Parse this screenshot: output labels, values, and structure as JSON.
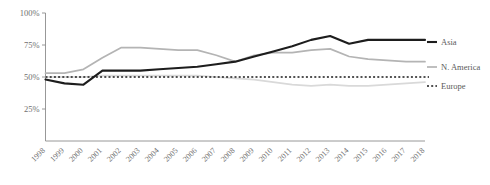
{
  "chart_data": {
    "type": "line",
    "title": "",
    "subtitle": "",
    "xlabel": "",
    "ylabel": "",
    "grid": false,
    "legend_position": "right",
    "xlim": [
      1998,
      2018
    ],
    "ylim": [
      0,
      100
    ],
    "y_tick_labels": [
      "100%",
      "75%",
      "50%",
      "25%"
    ],
    "y_tick_values": [
      100,
      75,
      50,
      25
    ],
    "x": [
      1998,
      1999,
      2000,
      2001,
      2002,
      2003,
      2004,
      2005,
      2006,
      2007,
      2008,
      2009,
      2010,
      2011,
      2012,
      2013,
      2014,
      2015,
      2016,
      2017,
      2018
    ],
    "x_tick_labels": [
      "1998",
      "1999",
      "2000",
      "2001",
      "2002",
      "2003",
      "2004",
      "2005",
      "2006",
      "2007",
      "2008",
      "2009",
      "2010",
      "2011",
      "2012",
      "2013",
      "2014",
      "2015",
      "2016",
      "2017",
      "2018"
    ],
    "series": [
      {
        "name": "Asia",
        "color": "#1d1d1d",
        "style": "solid",
        "width": 2.1,
        "values": [
          48,
          45,
          44,
          55,
          55,
          55,
          56,
          57,
          58,
          60,
          62,
          66,
          70,
          74,
          79,
          82,
          76,
          79,
          79,
          79,
          79
        ]
      },
      {
        "name": "N. America",
        "color": "#b4b4b4",
        "style": "solid",
        "width": 1.7,
        "values": [
          53,
          53,
          56,
          65,
          73,
          73,
          72,
          71,
          71,
          67,
          62,
          67,
          69,
          69,
          71,
          72,
          66,
          64,
          63,
          62,
          62
        ]
      },
      {
        "name": "Europe",
        "color": "#d9d9d9",
        "style": "solid",
        "width": 1.7,
        "values": [
          50,
          50,
          50,
          51,
          51,
          51,
          51,
          51,
          51,
          50,
          49,
          48,
          46,
          44,
          43,
          44,
          43,
          43,
          44,
          45,
          46
        ]
      }
    ],
    "reference_line": {
      "name": "50-percent-baseline",
      "value": 50,
      "style": "dotted",
      "color": "#1a1a1a"
    },
    "legend": [
      {
        "label": "Asia",
        "color": "#1d1d1d"
      },
      {
        "label": "N. America",
        "color": "#b4b4b4"
      },
      {
        "label": "Europe",
        "color": "#d9d9d9"
      }
    ]
  }
}
